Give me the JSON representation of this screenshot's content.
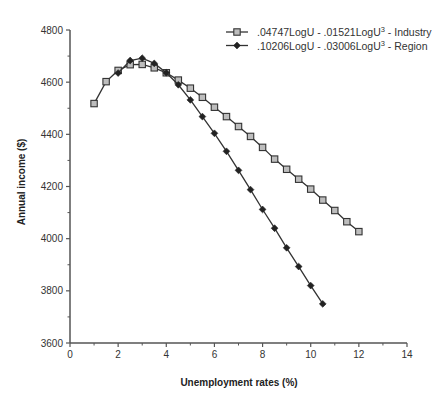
{
  "chart_data": {
    "type": "line",
    "title": "",
    "xlabel": "Unemployment rates (%)",
    "ylabel": "Annual income ($)",
    "xlim": [
      0,
      14
    ],
    "ylim": [
      3600,
      4800
    ],
    "xticks": [
      0,
      2,
      4,
      6,
      8,
      10,
      12,
      14
    ],
    "yticks": [
      3600,
      3800,
      4000,
      4200,
      4400,
      4600,
      4800
    ],
    "grid": false,
    "legend_position": "top-right",
    "series": [
      {
        "name": ".04747LogU - .01521LogU",
        "superscript": "3",
        "suffix": " - Industry",
        "marker": "square",
        "x": [
          1,
          1.5,
          2,
          2.5,
          3,
          3.5,
          4,
          4.5,
          5,
          5.5,
          6,
          6.5,
          7,
          7.5,
          8,
          8.5,
          9,
          9.5,
          10,
          10.5,
          11,
          11.5,
          12
        ],
        "y": [
          4518,
          4602,
          4645,
          4667,
          4668,
          4655,
          4636,
          4608,
          4577,
          4542,
          4504,
          4468,
          4430,
          4392,
          4350,
          4305,
          4266,
          4228,
          4190,
          4148,
          4108,
          4065,
          4027
        ]
      },
      {
        "name": ".10206LogU - .03006LogU",
        "superscript": "3",
        "suffix": " - Region",
        "marker": "diamond",
        "x": [
          2,
          2.5,
          3,
          3.5,
          4,
          4.5,
          5,
          5.5,
          6,
          6.5,
          7,
          7.5,
          8,
          8.5,
          9,
          9.5,
          10,
          10.5
        ],
        "y": [
          4635,
          4683,
          4692,
          4672,
          4636,
          4590,
          4532,
          4468,
          4404,
          4335,
          4262,
          4188,
          4112,
          4040,
          3965,
          3893,
          3820,
          3750
        ]
      }
    ]
  }
}
